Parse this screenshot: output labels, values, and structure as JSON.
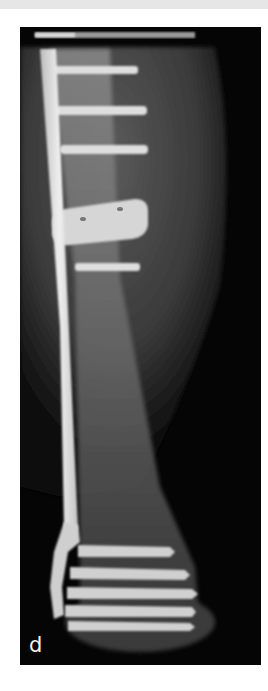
{
  "figure": {
    "panel_label": "d",
    "colors": {
      "background": "#050505",
      "soft_tissue": "#4a4a4a",
      "bone": "#7a7a7a",
      "implant": "#e0e0e0",
      "page": "#ffffff"
    }
  }
}
